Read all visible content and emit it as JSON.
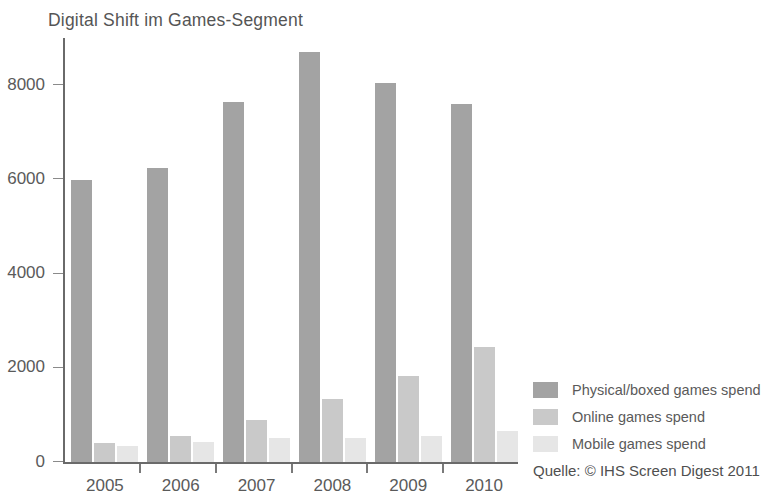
{
  "chart_data": {
    "type": "bar",
    "title": "Digital Shift im Games-Segment",
    "subtitle": "",
    "xlabel": "",
    "ylabel": "",
    "categories": [
      "2005",
      "2006",
      "2007",
      "2008",
      "2009",
      "2010"
    ],
    "series": [
      {
        "name": "Physical/boxed games spend",
        "color": "#a3a3a3",
        "values": [
          5980,
          6250,
          7650,
          8700,
          8050,
          7600
        ]
      },
      {
        "name": "Online games spend",
        "color": "#c9c9c9",
        "values": [
          400,
          550,
          900,
          1340,
          1830,
          2450
        ]
      },
      {
        "name": "Mobile games spend",
        "color": "#e6e6e6",
        "values": [
          350,
          430,
          500,
          520,
          560,
          650
        ]
      }
    ],
    "ylim": [
      0,
      9000
    ],
    "yticks": [
      0,
      2000,
      4000,
      6000,
      8000
    ],
    "ytick_labels": [
      "0",
      "2000",
      "4000",
      "6000",
      "8000"
    ],
    "grid": false,
    "legend_position": "right-bottom",
    "annotations": [
      {
        "name": "source",
        "text": "Quelle: © IHS Screen Digest 2011"
      }
    ]
  },
  "source": {
    "text": "Quelle: © IHS Screen Digest 2011"
  },
  "colors": {
    "axis": "#6a6a6a",
    "text": "#5a5a5a",
    "background": "#ffffff"
  }
}
